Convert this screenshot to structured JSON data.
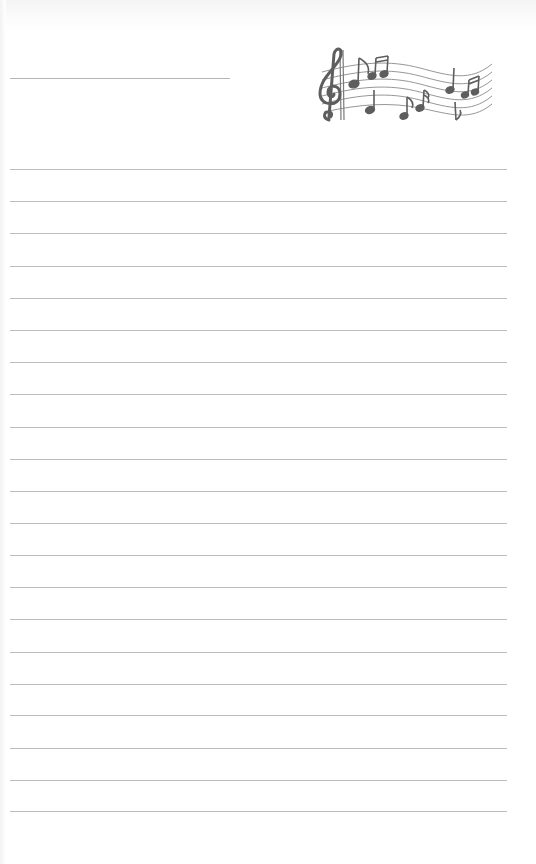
{
  "document": {
    "type": "lined-writing-paper",
    "background_color": "#ffffff",
    "line_color": "#bdbdbd",
    "decoration_color": "#6e6e6e"
  },
  "header": {
    "title_line": {
      "x": 10,
      "y": 78,
      "width": 220
    },
    "decoration": {
      "icon": "music-staff-with-treble-clef-icon",
      "x": 310,
      "y": 42,
      "width": 190,
      "height": 90
    }
  },
  "ruled_lines": {
    "count": 21,
    "x": 10,
    "width": 497,
    "first_y": 169,
    "spacing": 32.1,
    "positions": [
      169,
      201,
      233,
      266,
      298,
      330,
      362,
      394,
      427,
      459,
      491,
      523,
      555,
      587,
      619,
      652,
      684,
      715,
      748,
      780,
      811
    ]
  }
}
